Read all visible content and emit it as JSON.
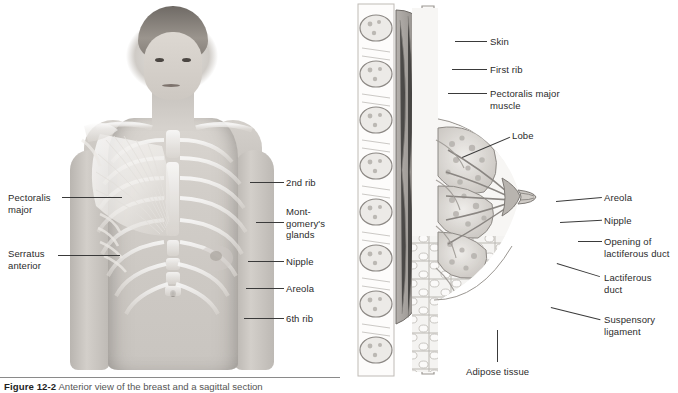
{
  "figure": {
    "caption_number": "Figure 12-2",
    "caption_text": "Anterior view of the breast and a sagittal section"
  },
  "left_panel": {
    "name": "anterior-view-photograph",
    "labels": [
      {
        "id": "pectoralis-major",
        "text": "Pectoralis\nmajor",
        "side": "left",
        "x": 8,
        "y": 192,
        "line_x1": 62,
        "line_y1": 197,
        "line_x2": 122,
        "line_y2": 190
      },
      {
        "id": "serratus-anterior",
        "text": "Serratus\nanterior",
        "side": "left",
        "x": 8,
        "y": 248,
        "line_x1": 58,
        "line_y1": 253,
        "line_x2": 118,
        "line_y2": 258
      },
      {
        "id": "second-rib",
        "text": "2nd rib",
        "side": "right",
        "x": 286,
        "y": 177,
        "line_x1": 252,
        "line_y1": 182,
        "line_x2": 284,
        "line_y2": 182
      },
      {
        "id": "montgomerys-glands",
        "text": "Mont-\ngomery's\nglands",
        "side": "right",
        "x": 286,
        "y": 206,
        "line_x1": 258,
        "line_y1": 224,
        "line_x2": 284,
        "line_y2": 224
      },
      {
        "id": "nipple",
        "text": "Nipple",
        "side": "right",
        "x": 286,
        "y": 256,
        "line_x1": 248,
        "line_y1": 261,
        "line_x2": 284,
        "line_y2": 261
      },
      {
        "id": "areola",
        "text": "Areola",
        "side": "right",
        "x": 286,
        "y": 283,
        "line_x1": 246,
        "line_y1": 288,
        "line_x2": 284,
        "line_y2": 288
      },
      {
        "id": "sixth-rib",
        "text": "6th rib",
        "side": "right",
        "x": 286,
        "y": 313,
        "line_x1": 244,
        "line_y1": 318,
        "line_x2": 284,
        "line_y2": 318
      }
    ]
  },
  "right_panel": {
    "name": "sagittal-section-illustration",
    "labels": [
      {
        "id": "skin",
        "text": "Skin",
        "x": 490,
        "y": 36,
        "line_x1": 455,
        "line_y1": 41,
        "line_x2": 487,
        "line_y2": 41
      },
      {
        "id": "first-rib",
        "text": "First rib",
        "x": 490,
        "y": 64,
        "line_x1": 452,
        "line_y1": 69,
        "line_x2": 487,
        "line_y2": 69
      },
      {
        "id": "pectoralis-major-muscle",
        "text": "Pectoralis major\nmuscle",
        "x": 490,
        "y": 88,
        "line_x1": 448,
        "line_y1": 93,
        "line_x2": 487,
        "line_y2": 93
      },
      {
        "id": "lobe",
        "text": "Lobe",
        "x": 512,
        "y": 130,
        "line_x1": 462,
        "line_y1": 156,
        "line_x2": 509,
        "line_y2": 136
      },
      {
        "id": "areola-sagittal",
        "text": "Areola",
        "x": 604,
        "y": 192,
        "line_x1": 556,
        "line_y1": 200,
        "line_x2": 601,
        "line_y2": 197
      },
      {
        "id": "nipple-sagittal",
        "text": "Nipple",
        "x": 604,
        "y": 215,
        "line_x1": 560,
        "line_y1": 221,
        "line_x2": 601,
        "line_y2": 220
      },
      {
        "id": "opening-lactiferous-duct",
        "text": "Opening of\nlactiferous duct",
        "x": 604,
        "y": 236,
        "line_x1": 578,
        "line_y1": 241,
        "line_x2": 601,
        "line_y2": 241
      },
      {
        "id": "lactiferous-duct",
        "text": "Lactiferous\nduct",
        "x": 604,
        "y": 272,
        "line_x1": 558,
        "line_y1": 262,
        "line_x2": 601,
        "line_y2": 277
      },
      {
        "id": "suspensory-ligament",
        "text": "Suspensory\nligament",
        "x": 604,
        "y": 314,
        "line_x1": 552,
        "line_y1": 306,
        "line_x2": 601,
        "line_y2": 319
      },
      {
        "id": "adipose-tissue",
        "text": "Adipose tissue",
        "x": 466,
        "y": 366,
        "line_x1": 497,
        "line_y1": 330,
        "line_x2": 497,
        "line_y2": 362
      }
    ]
  },
  "colors": {
    "label_text": "#2b2b2b",
    "leader_line": "#3a3a3a",
    "caption_rule": "#8a8a8a",
    "illustration_ink": "#6b6b6b",
    "illustration_fill_light": "#f2f1ef",
    "illustration_fill_mid": "#d8d5d1",
    "illustration_fill_dark": "#9a9691"
  }
}
